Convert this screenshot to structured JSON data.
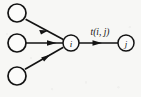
{
  "figure": {
    "type": "node-edge-diagram",
    "width": 141,
    "height": 97,
    "background_color": "#f7f7f5",
    "ink_color": "#131313"
  },
  "nodes": {
    "source_top": {
      "label": "",
      "cx": 17,
      "cy": 13,
      "r": 9
    },
    "source_middle": {
      "label": "",
      "cx": 17,
      "cy": 43,
      "r": 9
    },
    "source_bottom": {
      "label": "",
      "cx": 17,
      "cy": 76,
      "r": 9
    },
    "hub": {
      "label": "i",
      "cx": 71,
      "cy": 43,
      "r": 8
    },
    "target": {
      "label": "j",
      "cx": 126,
      "cy": 43,
      "r": 8
    }
  },
  "edges": {
    "top_in": {
      "label": "",
      "from": "source_top",
      "to": "hub"
    },
    "middle_in": {
      "label": "",
      "from": "source_middle",
      "to": "hub"
    },
    "bottom_in": {
      "label": "",
      "from": "source_bottom",
      "to": "hub"
    },
    "hub_to_target": {
      "label": "t(i, j)",
      "from": "hub",
      "to": "target"
    }
  }
}
